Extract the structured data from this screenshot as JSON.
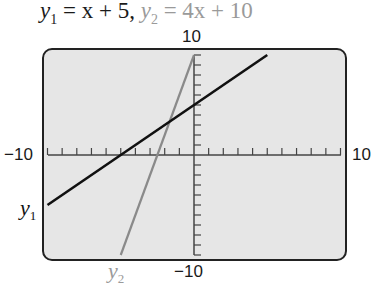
{
  "title": {
    "eq1_var": "y",
    "eq1_sub": "1",
    "eq1_rhs": " = x + 5,",
    "eq2_var": "y",
    "eq2_sub": "2",
    "eq2_rhs": " = 4x + 10"
  },
  "axes": {
    "y_max_label": "10",
    "y_min_label": "−10",
    "x_min_label": "−10",
    "x_max_label": "10"
  },
  "line_labels": {
    "y1_var": "y",
    "y1_sub": "1",
    "y2_var": "y",
    "y2_sub": "2"
  },
  "colors": {
    "y1": "#111111",
    "y2": "#8a8a8a",
    "screen_bg": "#e6e6e6",
    "frame": "#222222"
  },
  "chart_data": {
    "type": "line",
    "title": "y1 = x + 5, y2 = 4x + 10",
    "xlabel": "",
    "ylabel": "",
    "xlim": [
      -10,
      10
    ],
    "ylim": [
      -10,
      10
    ],
    "x_ticks_step": 1,
    "y_ticks_step": 1,
    "grid": false,
    "legend": "inline labels (y1 at left end, y2 at bottom end)",
    "series": [
      {
        "name": "y1",
        "equation": "y = x + 5",
        "color": "#111111",
        "x": [
          -10,
          5
        ],
        "y": [
          -5,
          10
        ]
      },
      {
        "name": "y2",
        "equation": "y = 4x + 10",
        "color": "#8a8a8a",
        "x": [
          -5,
          0
        ],
        "y": [
          -10,
          10
        ]
      }
    ],
    "intersection": {
      "x": -1.6667,
      "y": 3.3333
    }
  }
}
